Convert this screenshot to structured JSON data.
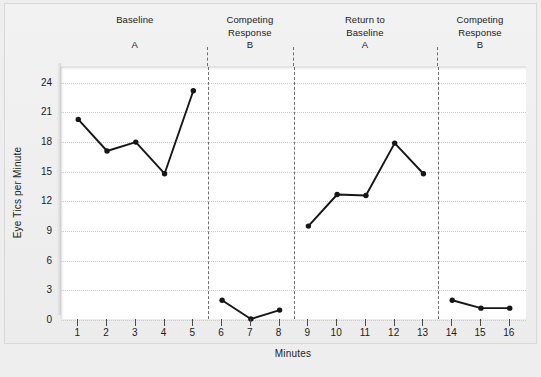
{
  "chart_data": {
    "type": "line",
    "title": "",
    "xlabel": "Minutes",
    "ylabel": "Eye Tics per Minute",
    "xlim": [
      0.4,
      16.6
    ],
    "ylim": [
      0,
      25.6
    ],
    "xticks": [
      1,
      2,
      3,
      4,
      5,
      6,
      7,
      8,
      9,
      10,
      11,
      12,
      13,
      14,
      15,
      16
    ],
    "yticks": [
      0,
      3,
      6,
      9,
      12,
      15,
      18,
      21,
      24
    ],
    "grid": "horizontal-dotted",
    "legend": "none",
    "marker": "filled-circle",
    "line_color": "#161616",
    "x": [
      1,
      2,
      3,
      4,
      5,
      6,
      7,
      8,
      9,
      10,
      11,
      12,
      13,
      14,
      15,
      16
    ],
    "values": [
      20.3,
      17.1,
      18.0,
      14.8,
      23.2,
      2.0,
      0.1,
      1.0,
      9.5,
      12.7,
      12.6,
      17.9,
      14.8,
      2.0,
      1.2,
      1.2
    ],
    "series": [
      {
        "name": "Eye Tics per Minute",
        "segments": [
          {
            "phase": "Baseline A",
            "x": [
              1,
              2,
              3,
              4,
              5
            ],
            "values": [
              20.3,
              17.1,
              18.0,
              14.8,
              23.2
            ]
          },
          {
            "phase": "Competing Response B",
            "x": [
              6,
              7,
              8
            ],
            "values": [
              2.0,
              0.1,
              1.0
            ]
          },
          {
            "phase": "Return to Baseline A",
            "x": [
              9,
              10,
              11,
              12,
              13
            ],
            "values": [
              9.5,
              12.7,
              12.6,
              17.9,
              14.8
            ]
          },
          {
            "phase": "Competing Response B",
            "x": [
              14,
              15,
              16
            ],
            "values": [
              2.0,
              1.2,
              1.2
            ]
          }
        ]
      }
    ],
    "phase_dividers": [
      5.5,
      8.5,
      13.5
    ],
    "phases": [
      {
        "lines": [
          "Baseline"
        ],
        "letter": "A",
        "center_x": 3.0
      },
      {
        "lines": [
          "Competing",
          "Response"
        ],
        "letter": "B",
        "center_x": 7.0
      },
      {
        "lines": [
          "Return to",
          "Baseline"
        ],
        "letter": "A",
        "center_x": 11.0
      },
      {
        "lines": [
          "Competing",
          "Response"
        ],
        "letter": "B",
        "center_x": 15.0
      }
    ]
  },
  "colors": {
    "figure_background": "#eeeeee",
    "panel_background": "#f0f0f0",
    "plot_background": "#ffffff",
    "gridline": "#c9c9c9",
    "divider": "#6f6f6f",
    "data": "#161616",
    "text": "#1b1b1b"
  },
  "phase_labels": [
    {
      "line1": "Baseline",
      "line2": "",
      "letter": "A"
    },
    {
      "line1": "Competing",
      "line2": "Response",
      "letter": "B"
    },
    {
      "line1": "Return to",
      "line2": "Baseline",
      "letter": "A"
    },
    {
      "line1": "Competing",
      "line2": "Response",
      "letter": "B"
    }
  ],
  "axis": {
    "x_title": "Minutes",
    "y_title": "Eye Tics per Minute",
    "x_tick_labels": [
      "1",
      "2",
      "3",
      "4",
      "5",
      "6",
      "7",
      "8",
      "9",
      "10",
      "11",
      "12",
      "13",
      "14",
      "15",
      "16"
    ],
    "y_tick_labels": [
      "0",
      "3",
      "6",
      "9",
      "12",
      "15",
      "18",
      "21",
      "24"
    ]
  }
}
